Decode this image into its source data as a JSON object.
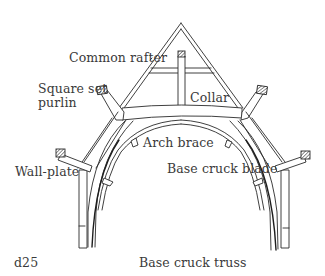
{
  "diagram": {
    "title": "Base cruck truss",
    "figure_id": "d25",
    "labels": {
      "common_rafter": "Common rafter",
      "square_set_purlin_line1": "Square set",
      "square_set_purlin_line2": "purlin",
      "collar": "Collar",
      "arch_brace": "Arch brace",
      "wall_plate": "Wall-plate",
      "base_cruck_blade": "Base cruck blade"
    },
    "colors": {
      "line": "#2a2a2a",
      "text": "#3a3a3a",
      "background": "#ffffff"
    }
  }
}
